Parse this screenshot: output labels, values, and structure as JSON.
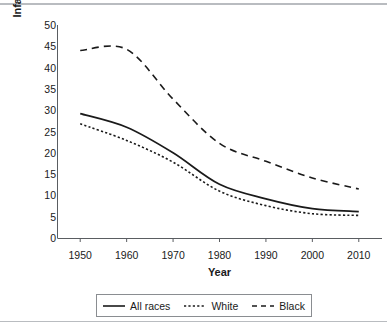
{
  "figure": {
    "ylabel": "Infant Deaths per 1,000 Live Births",
    "xlabel": "Year"
  },
  "chart_data": {
    "type": "line",
    "title": "",
    "xlabel": "Year",
    "ylabel": "Infant Deaths per 1,000 Live Births",
    "x": [
      1950,
      1960,
      1970,
      1980,
      1990,
      2000,
      2010
    ],
    "xlim": [
      1945,
      2015
    ],
    "ylim": [
      0,
      50
    ],
    "xticks": [
      "1950",
      "1960",
      "1970",
      "1980",
      "1990",
      "2000",
      "2010"
    ],
    "yticks": [
      "0",
      "5",
      "10",
      "15",
      "20",
      "25",
      "30",
      "35",
      "40",
      "45",
      "50"
    ],
    "grid": false,
    "legend_position": "below-axes",
    "series": [
      {
        "name": "All races",
        "style": "solid",
        "color": "#1a1a1a",
        "values": [
          29.2,
          26.0,
          20.0,
          12.6,
          9.2,
          6.9,
          6.2
        ]
      },
      {
        "name": "White",
        "style": "dotted",
        "color": "#1a1a1a",
        "values": [
          26.8,
          22.9,
          17.8,
          11.0,
          7.6,
          5.7,
          5.3
        ]
      },
      {
        "name": "Black",
        "style": "dashed",
        "color": "#1a1a1a",
        "values": [
          44.0,
          44.3,
          32.6,
          22.2,
          18.0,
          14.1,
          11.5
        ]
      }
    ]
  },
  "legend": {
    "items": [
      {
        "label": "All races",
        "style": "solid"
      },
      {
        "label": "White",
        "style": "dotted"
      },
      {
        "label": "Black",
        "style": "dashed"
      }
    ]
  },
  "colors": {
    "ink": "#1a1a1a",
    "axis": "#5a5d61",
    "rule": "#b9bcc0"
  }
}
